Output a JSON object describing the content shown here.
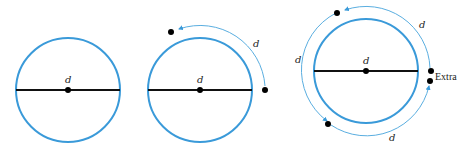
{
  "figure": {
    "colors": {
      "circle": "#3a9ad9",
      "arc": "#5aaee0",
      "diameter": "#111111",
      "dot": "#000000"
    },
    "panels": [
      {
        "id": "panel-1",
        "diameter_label": "d"
      },
      {
        "id": "panel-2",
        "diameter_label": "d",
        "arc_labels": [
          "d"
        ]
      },
      {
        "id": "panel-3",
        "diameter_label": "d",
        "arc_labels": [
          "d",
          "d",
          "d"
        ],
        "extra_label": "Extra"
      }
    ]
  }
}
